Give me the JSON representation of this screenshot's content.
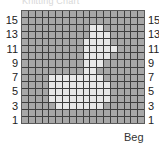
{
  "caption": "Knitting Chart",
  "chart_data": {
    "type": "heatmap",
    "columns": 18,
    "rows": 16,
    "row_labels": [
      "15",
      "13",
      "11",
      "9",
      "7",
      "5",
      "3",
      "1"
    ],
    "start_label": "Beg",
    "colors": {
      "background": "#a7a7a7",
      "motif": "#e8e8e8",
      "gridline": "#3e3e3e"
    },
    "motif_rows_top_to_bottom": [
      "000000000000000000",
      "000000000000000000",
      "000000000011000000",
      "000000000011100000",
      "000000000111100000",
      "000000000111110000",
      "000000000111100000",
      "000000000111000000",
      "000000000110000000",
      "000011111111000000",
      "000011111111100000",
      "000011111111100000",
      "000011111111100000",
      "000001111111000000",
      "000000000000000000",
      "000000000000000000"
    ]
  }
}
